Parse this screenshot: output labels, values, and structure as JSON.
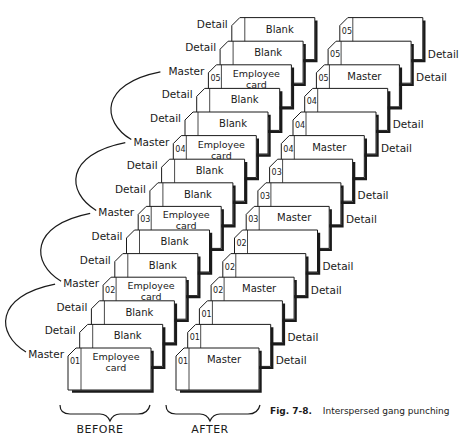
{
  "figure": {
    "caption_number": "Fig. 7-8.",
    "caption_title": "Interspersed gang punching",
    "groups": [
      {
        "id": "before",
        "label": "BEFORE"
      },
      {
        "id": "after",
        "label": "AFTER"
      }
    ],
    "before": {
      "cards": [
        {
          "number": "01",
          "text": [
            "Employee",
            "card"
          ],
          "side_label": "Master"
        },
        {
          "number": "",
          "text": [
            "Blank"
          ],
          "side_label": "Detail"
        },
        {
          "number": "",
          "text": [
            "Blank"
          ],
          "side_label": "Detail"
        },
        {
          "number": "02",
          "text": [
            "Employee",
            "card"
          ],
          "side_label": "Master"
        },
        {
          "number": "",
          "text": [
            "Blank"
          ],
          "side_label": "Detail"
        },
        {
          "number": "",
          "text": [
            "Blank"
          ],
          "side_label": "Detail"
        },
        {
          "number": "03",
          "text": [
            "Employee",
            "card"
          ],
          "side_label": "Master"
        },
        {
          "number": "",
          "text": [
            "Blank"
          ],
          "side_label": "Detail"
        },
        {
          "number": "",
          "text": [
            "Blank"
          ],
          "side_label": "Detail"
        },
        {
          "number": "04",
          "text": [
            "Employee",
            "card"
          ],
          "side_label": "Master"
        },
        {
          "number": "",
          "text": [
            "Blank"
          ],
          "side_label": "Detail"
        },
        {
          "number": "",
          "text": [
            "Blank"
          ],
          "side_label": "Detail"
        },
        {
          "number": "05",
          "text": [
            "Employee",
            "card"
          ],
          "side_label": "Master"
        },
        {
          "number": "",
          "text": [
            "Blank"
          ],
          "side_label": "Detail"
        },
        {
          "number": "",
          "text": [
            "Blank"
          ],
          "side_label": "Detail"
        }
      ]
    },
    "after": {
      "cards": [
        {
          "number": "01",
          "text": [
            "Master"
          ],
          "side_label": ""
        },
        {
          "number": "01",
          "text": [],
          "side_label": "Detail"
        },
        {
          "number": "01",
          "text": [],
          "side_label": "Detail"
        },
        {
          "number": "02",
          "text": [
            "Master"
          ],
          "side_label": ""
        },
        {
          "number": "02",
          "text": [],
          "side_label": "Detail"
        },
        {
          "number": "02",
          "text": [],
          "side_label": "Detail"
        },
        {
          "number": "03",
          "text": [
            "Master"
          ],
          "side_label": ""
        },
        {
          "number": "03",
          "text": [],
          "side_label": "Detail"
        },
        {
          "number": "03",
          "text": [],
          "side_label": "Detail"
        },
        {
          "number": "04",
          "text": [
            "Master"
          ],
          "side_label": ""
        },
        {
          "number": "04",
          "text": [],
          "side_label": "Detail"
        },
        {
          "number": "04",
          "text": [],
          "side_label": "Detail"
        },
        {
          "number": "05",
          "text": [
            "Master"
          ],
          "side_label": ""
        },
        {
          "number": "05",
          "text": [],
          "side_label": "Detail"
        },
        {
          "number": "05",
          "text": [],
          "side_label": "Detail"
        }
      ]
    }
  }
}
